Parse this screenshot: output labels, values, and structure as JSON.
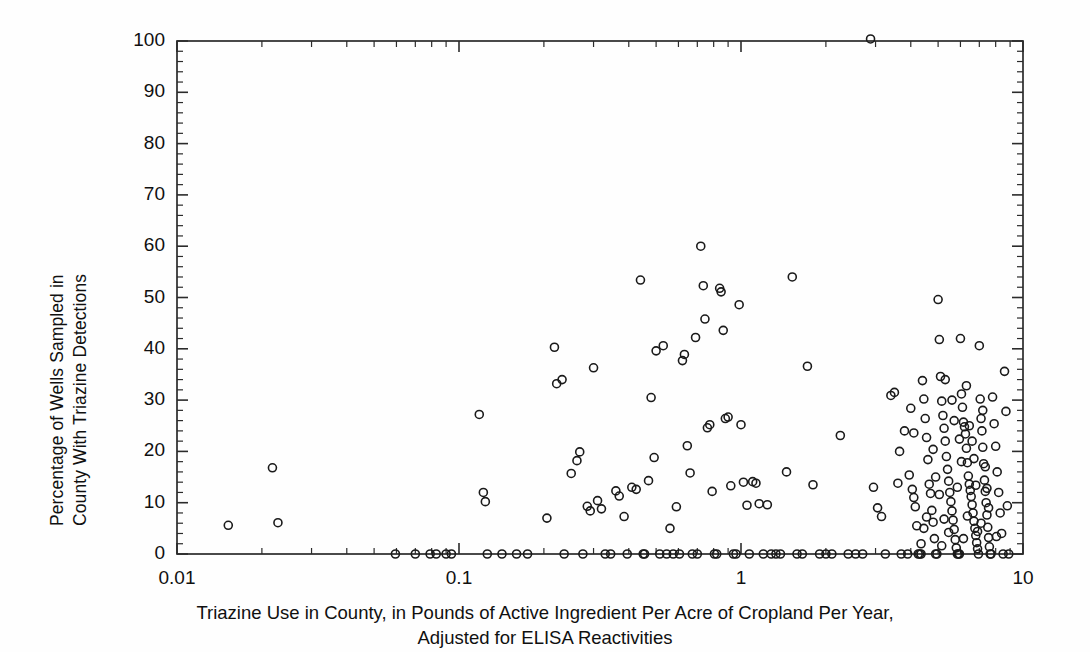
{
  "chart_data": {
    "type": "scatter",
    "title": "",
    "xlabel": "Triazine Use in County, in Pounds of Active Ingredient Per Acre of Cropland Per Year, Adjusted for ELISA Reactivities",
    "xlabel_line1": "Triazine Use in County, in Pounds of Active Ingredient Per Acre of Cropland Per Year,",
    "xlabel_line2": "Adjusted for ELISA Reactivities",
    "ylabel": "Percentage of Wells Sampled in County With Triazine Detections",
    "ylabel_line1": "Percentage of Wells Sampled in",
    "ylabel_line2": "County With Triazine Detections",
    "xscale": "log",
    "yscale": "linear",
    "xlim": [
      0.01,
      10
    ],
    "ylim": [
      0,
      100
    ],
    "xticks": [
      "0.01",
      "0.1",
      "1",
      "10"
    ],
    "xtick_values": [
      0.01,
      0.1,
      1,
      10
    ],
    "yticks": [
      "0",
      "10",
      "20",
      "30",
      "40",
      "50",
      "60",
      "70",
      "80",
      "90",
      "100"
    ],
    "ytick_values": [
      0,
      10,
      20,
      30,
      40,
      50,
      60,
      70,
      80,
      90,
      100
    ],
    "y_minor_step": 2,
    "grid": false,
    "legend": null,
    "marker": "open-circle",
    "marker_color": "#1a1a1a",
    "marker_size_px": 8,
    "frame_color": "#2b2b2b",
    "background": "#ffffff",
    "series": [
      {
        "name": "Counties",
        "points": [
          [
            0.0152,
            5.6
          ],
          [
            0.0218,
            16.8
          ],
          [
            0.0228,
            6.1
          ],
          [
            0.0595,
            0.0
          ],
          [
            0.07,
            0.0
          ],
          [
            0.079,
            0.0
          ],
          [
            0.083,
            0.0
          ],
          [
            0.09,
            0.0
          ],
          [
            0.094,
            0.0
          ],
          [
            0.118,
            27.2
          ],
          [
            0.122,
            12.0
          ],
          [
            0.124,
            10.2
          ],
          [
            0.126,
            0.0
          ],
          [
            0.142,
            0.0
          ],
          [
            0.16,
            0.0
          ],
          [
            0.175,
            0.0
          ],
          [
            0.205,
            7.0
          ],
          [
            0.218,
            40.3
          ],
          [
            0.222,
            33.2
          ],
          [
            0.232,
            34.0
          ],
          [
            0.236,
            0.0
          ],
          [
            0.25,
            15.7
          ],
          [
            0.262,
            18.2
          ],
          [
            0.268,
            19.9
          ],
          [
            0.275,
            0.0
          ],
          [
            0.285,
            9.3
          ],
          [
            0.292,
            8.4
          ],
          [
            0.3,
            36.3
          ],
          [
            0.31,
            10.4
          ],
          [
            0.32,
            8.8
          ],
          [
            0.33,
            0.0
          ],
          [
            0.345,
            0.0
          ],
          [
            0.36,
            12.3
          ],
          [
            0.37,
            11.3
          ],
          [
            0.385,
            7.3
          ],
          [
            0.395,
            0.0
          ],
          [
            0.41,
            13.0
          ],
          [
            0.425,
            12.6
          ],
          [
            0.44,
            53.4
          ],
          [
            0.45,
            0.0
          ],
          [
            0.455,
            0.0
          ],
          [
            0.47,
            14.3
          ],
          [
            0.48,
            30.5
          ],
          [
            0.492,
            18.8
          ],
          [
            0.5,
            39.6
          ],
          [
            0.515,
            0.0
          ],
          [
            0.53,
            40.6
          ],
          [
            0.545,
            0.0
          ],
          [
            0.56,
            5.0
          ],
          [
            0.575,
            0.0
          ],
          [
            0.59,
            9.2
          ],
          [
            0.605,
            0.0
          ],
          [
            0.62,
            37.7
          ],
          [
            0.63,
            38.9
          ],
          [
            0.645,
            21.1
          ],
          [
            0.66,
            15.8
          ],
          [
            0.672,
            0.0
          ],
          [
            0.69,
            42.2
          ],
          [
            0.7,
            0.0
          ],
          [
            0.72,
            60.0
          ],
          [
            0.735,
            52.3
          ],
          [
            0.745,
            45.8
          ],
          [
            0.76,
            24.6
          ],
          [
            0.775,
            25.2
          ],
          [
            0.79,
            12.2
          ],
          [
            0.805,
            0.0
          ],
          [
            0.82,
            0.0
          ],
          [
            0.84,
            51.8
          ],
          [
            0.85,
            51.1
          ],
          [
            0.865,
            43.6
          ],
          [
            0.88,
            26.4
          ],
          [
            0.9,
            26.7
          ],
          [
            0.92,
            13.3
          ],
          [
            0.94,
            0.0
          ],
          [
            0.96,
            0.0
          ],
          [
            0.985,
            48.6
          ],
          [
            1.0,
            25.2
          ],
          [
            1.02,
            14.0
          ],
          [
            1.05,
            9.5
          ],
          [
            1.07,
            0.0
          ],
          [
            1.1,
            14.1
          ],
          [
            1.13,
            13.8
          ],
          [
            1.16,
            9.8
          ],
          [
            1.2,
            0.0
          ],
          [
            1.24,
            9.6
          ],
          [
            1.28,
            0.0
          ],
          [
            1.33,
            0.0
          ],
          [
            1.38,
            0.0
          ],
          [
            1.45,
            16.0
          ],
          [
            1.52,
            54.0
          ],
          [
            1.58,
            0.0
          ],
          [
            1.65,
            0.0
          ],
          [
            1.72,
            36.6
          ],
          [
            1.8,
            13.5
          ],
          [
            1.9,
            0.0
          ],
          [
            2.0,
            0.0
          ],
          [
            2.1,
            0.0
          ],
          [
            2.25,
            23.1
          ],
          [
            2.4,
            0.0
          ],
          [
            2.55,
            0.0
          ],
          [
            2.7,
            0.0
          ],
          [
            2.88,
            100.4
          ],
          [
            2.95,
            13.0
          ],
          [
            3.05,
            9.0
          ],
          [
            3.15,
            7.3
          ],
          [
            3.25,
            0.0
          ],
          [
            3.4,
            30.9
          ],
          [
            3.5,
            31.5
          ],
          [
            3.6,
            13.8
          ],
          [
            3.7,
            0.0
          ],
          [
            3.8,
            24.0
          ],
          [
            3.9,
            0.0
          ],
          [
            4.0,
            28.4
          ],
          [
            4.05,
            12.6
          ],
          [
            4.1,
            11.0
          ],
          [
            4.15,
            9.2
          ],
          [
            4.2,
            5.5
          ],
          [
            4.25,
            0.0
          ],
          [
            4.3,
            0.0
          ],
          [
            4.35,
            0.0
          ],
          [
            4.4,
            33.8
          ],
          [
            4.45,
            30.2
          ],
          [
            4.5,
            26.4
          ],
          [
            4.55,
            22.7
          ],
          [
            4.6,
            18.4
          ],
          [
            4.65,
            13.6
          ],
          [
            4.7,
            11.8
          ],
          [
            4.75,
            8.5
          ],
          [
            4.8,
            6.2
          ],
          [
            4.85,
            3.0
          ],
          [
            4.9,
            0.0
          ],
          [
            4.95,
            0.0
          ],
          [
            5.0,
            49.6
          ],
          [
            5.05,
            41.8
          ],
          [
            5.1,
            34.6
          ],
          [
            5.15,
            29.8
          ],
          [
            5.2,
            27.0
          ],
          [
            5.25,
            24.5
          ],
          [
            5.3,
            22.0
          ],
          [
            5.35,
            19.0
          ],
          [
            5.4,
            16.5
          ],
          [
            5.45,
            14.2
          ],
          [
            5.5,
            12.0
          ],
          [
            5.55,
            10.2
          ],
          [
            5.6,
            8.4
          ],
          [
            5.65,
            6.6
          ],
          [
            5.7,
            4.8
          ],
          [
            5.75,
            2.8
          ],
          [
            5.8,
            1.2
          ],
          [
            5.85,
            0.0
          ],
          [
            5.9,
            0.0
          ],
          [
            5.95,
            0.0
          ],
          [
            6.0,
            42.0
          ],
          [
            6.05,
            31.2
          ],
          [
            6.1,
            28.6
          ],
          [
            6.15,
            25.7
          ],
          [
            6.2,
            24.8
          ],
          [
            6.25,
            23.4
          ],
          [
            6.3,
            20.6
          ],
          [
            6.35,
            17.8
          ],
          [
            6.4,
            15.2
          ],
          [
            6.45,
            13.6
          ],
          [
            6.5,
            12.4
          ],
          [
            6.55,
            11.2
          ],
          [
            6.6,
            9.6
          ],
          [
            6.65,
            8.0
          ],
          [
            6.7,
            6.4
          ],
          [
            6.75,
            5.0
          ],
          [
            6.8,
            3.6
          ],
          [
            6.85,
            2.2
          ],
          [
            6.9,
            1.0
          ],
          [
            6.95,
            0.0
          ],
          [
            7.0,
            40.6
          ],
          [
            7.05,
            30.2
          ],
          [
            7.1,
            26.4
          ],
          [
            7.15,
            24.0
          ],
          [
            7.2,
            20.8
          ],
          [
            7.25,
            17.6
          ],
          [
            7.3,
            14.4
          ],
          [
            7.35,
            12.2
          ],
          [
            7.4,
            10.0
          ],
          [
            7.45,
            7.6
          ],
          [
            7.5,
            5.2
          ],
          [
            7.55,
            3.2
          ],
          [
            7.6,
            1.4
          ],
          [
            7.65,
            0.0
          ],
          [
            7.7,
            0.0
          ],
          [
            7.8,
            30.6
          ],
          [
            7.9,
            25.4
          ],
          [
            8.0,
            21.0
          ],
          [
            8.1,
            16.0
          ],
          [
            8.2,
            12.0
          ],
          [
            8.3,
            8.0
          ],
          [
            8.4,
            4.0
          ],
          [
            8.5,
            0.0
          ],
          [
            8.6,
            35.6
          ],
          [
            8.7,
            27.8
          ],
          [
            8.8,
            9.4
          ],
          [
            8.9,
            0.0
          ],
          [
            5.3,
            34.0
          ],
          [
            5.6,
            30.0
          ],
          [
            6.3,
            32.8
          ],
          [
            4.8,
            20.4
          ],
          [
            6.05,
            18.0
          ],
          [
            5.95,
            22.4
          ],
          [
            7.35,
            17.0
          ],
          [
            6.6,
            22.0
          ],
          [
            5.05,
            11.6
          ],
          [
            5.85,
            13.0
          ],
          [
            6.35,
            7.4
          ],
          [
            7.1,
            6.0
          ],
          [
            4.55,
            7.2
          ],
          [
            5.45,
            4.2
          ],
          [
            6.15,
            3.0
          ],
          [
            6.9,
            4.4
          ],
          [
            4.35,
            2.0
          ],
          [
            5.15,
            1.6
          ],
          [
            7.45,
            12.8
          ],
          [
            8.05,
            3.4
          ],
          [
            3.95,
            15.4
          ],
          [
            4.1,
            23.6
          ],
          [
            3.65,
            20.0
          ],
          [
            4.9,
            15.0
          ],
          [
            5.7,
            26.0
          ],
          [
            6.45,
            25.0
          ],
          [
            7.2,
            28.0
          ],
          [
            6.8,
            13.4
          ],
          [
            5.25,
            6.8
          ],
          [
            6.7,
            18.6
          ],
          [
            4.45,
            5.0
          ],
          [
            7.55,
            9.0
          ]
        ]
      }
    ]
  },
  "axes": {
    "ylabel_line1": "Percentage of Wells Sampled in",
    "ylabel_line2": "County With Triazine Detections",
    "xlabel_line1": "Triazine Use in County, in Pounds of Active Ingredient Per Acre of Cropland Per Year,",
    "xlabel_line2": "Adjusted for ELISA Reactivities"
  }
}
